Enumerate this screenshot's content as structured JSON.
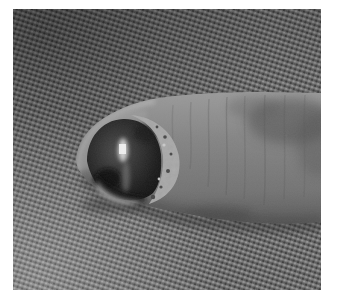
{
  "page": {
    "background": "#ffffff"
  },
  "photo": {
    "alt": "Close-up grayscale photograph of a fingertip pointing left, with a dark domed fingernail showing a vertical light reflection, pale scaly crusted tissue along the nail fold, and skin creases along the finger, resting on a coarsely woven fabric background inside a white margin",
    "palette": {
      "margin_white": "#ffffff",
      "fabric_base": "#6b6b6b",
      "fabric_dot_light": "#9e9e9e",
      "fabric_dot_mid": "#7d7d7d",
      "fabric_dot_shade": "#565656",
      "fabric_dot_dark": "#383838",
      "skin_light": "#9a9a9a",
      "skin_mid": "#858585",
      "skin_low": "#747474",
      "skin_dark": "#5c5c5c",
      "rim_highlight": "#b8b8b8",
      "nail_edge_dark": "#141414",
      "nail_core": "#4f4f4f",
      "nail_highlight": "#e4e4e4",
      "scale_light": "#a8a8a8",
      "scale_speck_dark": "#4a4a4a",
      "hyponychium_light": "#9f9f9f",
      "contact_shadow": "#2e2e2e",
      "grain_gray": "#808080"
    }
  }
}
